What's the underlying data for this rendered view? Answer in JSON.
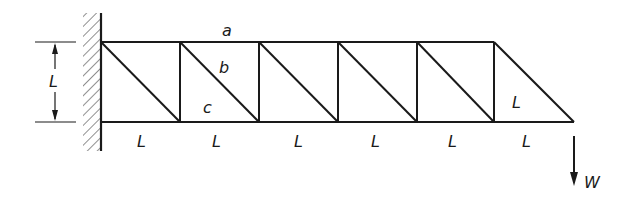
{
  "diagram": {
    "type": "cantilever truss",
    "colors": {
      "line": "#1a1a1a",
      "background": "#ffffff"
    },
    "member_labels": {
      "top": "a",
      "diagonal": "b",
      "bottom": "c"
    },
    "height_label": "L",
    "last_panel_label": "L",
    "panel_labels": [
      "L",
      "L",
      "L",
      "L",
      "L",
      "L"
    ],
    "load_label": "W",
    "panels": 6,
    "support": "fixed wall"
  }
}
